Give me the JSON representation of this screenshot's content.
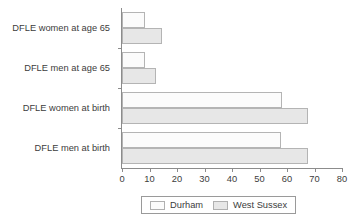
{
  "chart_data": {
    "type": "bar",
    "orientation": "horizontal",
    "title": "",
    "xlabel": "",
    "ylabel": "",
    "xlim": [
      0,
      80
    ],
    "ylim": null,
    "grid": false,
    "legend_position": "bottom",
    "categories": [
      "DFLE women at age 65",
      "DFLE men at age 65",
      "DFLE women at birth",
      "DFLE men at birth"
    ],
    "series": [
      {
        "name": "Durham",
        "color": "#fbfbfb",
        "values": [
          8.3,
          8.3,
          58.2,
          57.8
        ]
      },
      {
        "name": "West Sussex",
        "color": "#e7e7e7",
        "values": [
          14.5,
          12.5,
          67.6,
          67.6
        ]
      }
    ],
    "xticks": [
      0,
      10,
      20,
      30,
      40,
      50,
      60,
      70,
      80
    ],
    "xtick_labels": [
      "0",
      "10",
      "20",
      "30",
      "40",
      "50",
      "60",
      "70",
      "80"
    ]
  },
  "legend": {
    "items": [
      {
        "label": "Durham",
        "swatch_class": "s-durham"
      },
      {
        "label": "West Sussex",
        "swatch_class": "s-westsussex"
      }
    ]
  },
  "colors": {
    "durham": "#fbfbfb",
    "west_sussex": "#e7e7e7",
    "axis": "#8c8c8c",
    "bar_border": "#b4b4b4",
    "text": "#3c3c3c"
  }
}
